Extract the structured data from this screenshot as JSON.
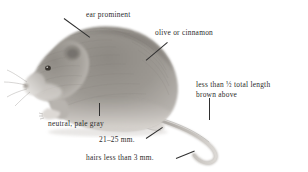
{
  "figure": {
    "style": "grayscale-field-guide-drawing",
    "background_color": "#ffffff",
    "ink_color": "#2b2b2b",
    "fur_colors": {
      "body_mid": "#9a9691",
      "body_dark": "#6f6b67",
      "body_light": "#c9c5c0",
      "belly": "#d8d4cf",
      "eye": "#3a3631",
      "tail": "#b9b5b0"
    }
  },
  "annotations": [
    {
      "id": "ear-prominent",
      "text": "ear  prominent",
      "points_to": "ear"
    },
    {
      "id": "olive-or-cinnamon",
      "text": "olive or cinnamon",
      "points_to": "back-fur"
    },
    {
      "id": "tail-length",
      "line1_prefix": "less than ",
      "line1_fraction": "½",
      "line1_suffix": " total length",
      "line2": "brown above",
      "points_to": "tail"
    },
    {
      "id": "neutral-pale-gray",
      "text": "neutral, pale gray",
      "points_to": "belly"
    },
    {
      "id": "hind-foot-measure",
      "text": "21–25 mm.",
      "points_to": "hind-foot"
    },
    {
      "id": "tail-hairs-measure",
      "text": "hairs less than 3 mm.",
      "points_to": "tail-tip"
    }
  ]
}
